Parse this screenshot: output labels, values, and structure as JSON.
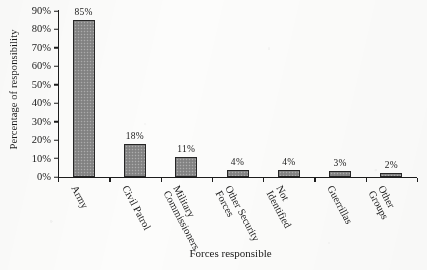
{
  "chart_data": {
    "type": "bar",
    "title": "",
    "xlabel": "Forces responsible",
    "ylabel": "Percentage of responsibility",
    "categories": [
      "Army",
      "Civil Patrol",
      "Military Commissioners",
      "Other Security Forces",
      "Not Identified",
      "Guerrillas",
      "Other Groups"
    ],
    "category_lines": [
      [
        "Army"
      ],
      [
        "Civil Patrol"
      ],
      [
        "Military",
        "Commissioners"
      ],
      [
        "Other Security",
        "Forces"
      ],
      [
        "Not",
        "Identified"
      ],
      [
        "Guerrillas"
      ],
      [
        "Other",
        "Groups"
      ]
    ],
    "values": [
      85,
      18,
      11,
      4,
      4,
      3,
      2
    ],
    "value_labels": [
      "85%",
      "18%",
      "11%",
      "4%",
      "4%",
      "3%",
      "2%"
    ],
    "ylim": [
      0,
      90
    ],
    "ytick_values": [
      0,
      10,
      20,
      30,
      40,
      50,
      60,
      70,
      80,
      90
    ],
    "ytick_labels": [
      "0%",
      "10%",
      "20%",
      "30%",
      "40%",
      "50%",
      "60%",
      "70%",
      "80%",
      "90%"
    ],
    "grid": false,
    "legend": null,
    "bar_color": "#8a8a8a",
    "bar_edge_color": "#262626",
    "axis_color": "#1d1d1d",
    "background_color": "#fcfcfb"
  }
}
